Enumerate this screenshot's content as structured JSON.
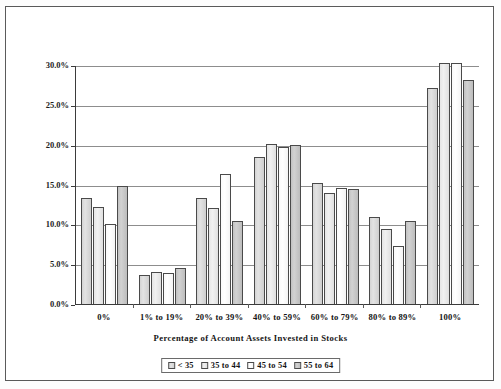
{
  "chart_data": {
    "type": "bar",
    "title": "",
    "xlabel": "Percentage of Account Assets Invested in Stocks",
    "ylabel": "Percentage of Account Owners",
    "categories": [
      "0%",
      "1% to 19%",
      "20% to 39%",
      "40% to 59%",
      "60% to 79%",
      "80% to 89%",
      "100%"
    ],
    "series": [
      {
        "name": "< 35",
        "color": "#d6d6d6",
        "values": [
          13.3,
          3.7,
          13.3,
          18.4,
          15.2,
          10.9,
          27.1
        ]
      },
      {
        "name": "35 to 44",
        "color": "#ececec",
        "values": [
          12.2,
          4.0,
          12.1,
          20.1,
          13.9,
          9.4,
          30.2
        ]
      },
      {
        "name": "45 to 54",
        "color": "#fcfcfc",
        "values": [
          10.1,
          3.9,
          16.3,
          19.7,
          14.5,
          7.3,
          30.2
        ]
      },
      {
        "name": "55 to 64",
        "color": "#c4c4c4",
        "values": [
          14.8,
          4.5,
          10.4,
          19.9,
          14.4,
          10.4,
          28.1
        ]
      }
    ],
    "ylim": [
      0,
      30
    ],
    "ytick_values": [
      0,
      5,
      10,
      15,
      20,
      25,
      30
    ],
    "ytick_labels": [
      "0.0%",
      "5.0%",
      "10.0%",
      "15.0%",
      "20.0%",
      "25.0%",
      "30.0%"
    ],
    "grid": "horizontal",
    "legend_position": "bottom-center",
    "axis_color": "#3b3b3b",
    "grid_color": "#8d8d8d"
  }
}
